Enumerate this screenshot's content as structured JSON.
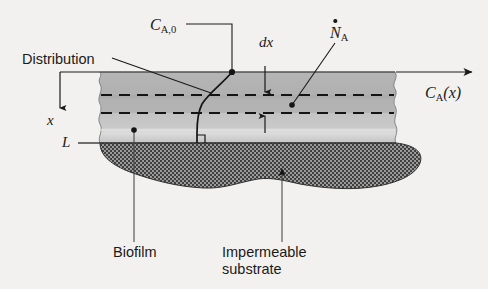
{
  "figure": {
    "type": "schematic-diagram",
    "background_color": "#f2f1ef"
  },
  "labels": {
    "distribution": "Distribution",
    "biofilm": "Biofilm",
    "substrate_line1": "Impermeable",
    "substrate_line2": "substrate",
    "surface_concentration": "C",
    "surface_concentration_sub": "A,0",
    "differential_thickness": "dx",
    "molar_flux": "N",
    "molar_flux_sub": "A",
    "concentration_profile": "C",
    "concentration_profile_sub": "A",
    "concentration_profile_arg": "(x)",
    "depth_axis": "x",
    "film_thickness": "L"
  },
  "colors": {
    "biofilm_upper": "#b9b9b9",
    "biofilm_lower": "#cccccc",
    "biofilm_band": "#ababab",
    "substrate_fill": "#8f8f8f",
    "substrate_hatch": "#3c3c3c",
    "line": "#1a1a1a",
    "label_text": "#1a1a1a"
  },
  "geometry": {
    "biofilm_top_y": 72,
    "biofilm_bottom_y": 143,
    "dx_upper_dashed_y": 95,
    "dx_lower_dashed_y": 113,
    "left_break_x": 100,
    "right_break_x": 395,
    "profile_surface_point_x": 232,
    "profile_base_x": 197
  },
  "annotations": [
    {
      "name": "surface-concentration",
      "text": "C_A,0",
      "leader": "horizontal-then-down to film surface point"
    },
    {
      "name": "differential-element",
      "text": "dx",
      "leader": "double-headed arrows between two dashed lines"
    },
    {
      "name": "molar-flux",
      "text": "N_A (dot)",
      "leader": "diagonal to point inside differential element"
    },
    {
      "name": "concentration-profile",
      "text": "C_A(x)",
      "leader": "horizontal arrow to the right"
    },
    {
      "name": "depth-axis",
      "text": "x",
      "leader": "vertical arrow pointing down from surface"
    },
    {
      "name": "film-thickness",
      "text": "L",
      "leader": "horizontal tick at biofilm/substrate interface"
    },
    {
      "name": "distribution-curve",
      "text": "Distribution",
      "leader": "diagonal to concentration curve"
    },
    {
      "name": "biofilm-region",
      "text": "Biofilm",
      "leader": "vertical line up into light gray film"
    },
    {
      "name": "substrate-region",
      "text": "Impermeable substrate",
      "leader": "vertical line up into hatched region"
    }
  ]
}
